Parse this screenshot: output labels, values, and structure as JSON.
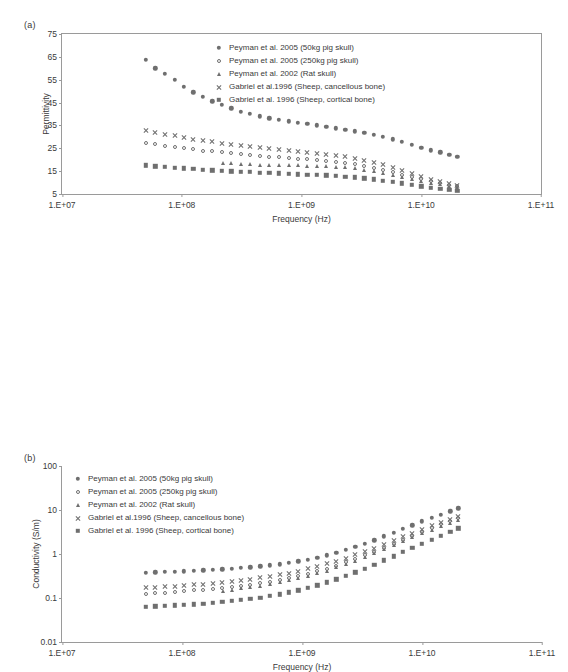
{
  "figure": {
    "panels": [
      {
        "id": "a",
        "label": "(a)",
        "axis_title_x": "Frequency (Hz)",
        "axis_title_y": "Permittivity"
      },
      {
        "id": "b",
        "label": "(b)",
        "axis_title_x": "Frequency (Hz)",
        "axis_title_y": "Conductivity (S/m)"
      }
    ]
  },
  "legend_entries": [
    {
      "marker": "circle-filled",
      "label": "Peyman et al. 2005 (50kg pig skull)"
    },
    {
      "marker": "circle-open",
      "label": "Peyman et al. 2005 (250kg pig skull)"
    },
    {
      "marker": "triangle-filled",
      "label": "Peyman et al. 2002 (Rat skull)"
    },
    {
      "marker": "cross",
      "label": "Gabriel et al.1996 (Sheep, cancellous bone)"
    },
    {
      "marker": "square-filled",
      "label": "Gabriel et al. 1996 (Sheep, cortical bone)"
    }
  ],
  "colors": {
    "marker": "#6f6f6f",
    "axis": "#9a9a9a",
    "text": "#3a3a3a",
    "background": "#ffffff"
  },
  "chart_data": [
    {
      "type": "scatter",
      "panel": "a",
      "title": "",
      "xlabel": "Frequency (Hz)",
      "ylabel": "Permittivity",
      "xscale": "log",
      "yscale": "linear",
      "xlim": [
        10000000,
        100000000000
      ],
      "ylim": [
        5,
        75
      ],
      "xticks": [
        10000000,
        100000000,
        1000000000,
        10000000000,
        100000000000
      ],
      "xticklabels": [
        "1.E+07",
        "1.E+08",
        "1.E+09",
        "1.E+10",
        "1.E+11"
      ],
      "yticks": [
        5,
        15,
        25,
        35,
        45,
        55,
        65,
        75
      ],
      "yticklabels": [
        "5",
        "15",
        "25",
        "35",
        "45",
        "55",
        "65",
        "75"
      ],
      "grid": false,
      "legend_position": "upper-right-inside",
      "series": [
        {
          "name": "Peyman et al. 2005 (50kg pig skull)",
          "marker": "circle-filled",
          "x": [
            50000000.0,
            60000000.0,
            72000000.0,
            87000000.0,
            104000000.0,
            125000000.0,
            150000000.0,
            180000000.0,
            216000000.0,
            260000000.0,
            310000000.0,
            370000000.0,
            450000000.0,
            540000000.0,
            650000000.0,
            780000000.0,
            930000000.0,
            1120000000.0,
            1340000000.0,
            1610000000.0,
            1930000000.0,
            2320000000.0,
            2780000000.0,
            3340000000.0,
            4000000000.0,
            4800000000.0,
            5800000000.0,
            6900000000.0,
            8300000000.0,
            10000000000.0,
            12000000000.0,
            14400000000.0,
            17200000000.0,
            20000000000.0
          ],
          "y": [
            63.8,
            60.0,
            57.5,
            55.0,
            52.0,
            49.5,
            47.5,
            45.5,
            44.0,
            42.5,
            41.0,
            40.0,
            39.0,
            38.2,
            37.5,
            36.8,
            36.2,
            35.6,
            35.0,
            34.4,
            33.8,
            33.2,
            32.5,
            31.8,
            31.0,
            30.0,
            29.0,
            27.8,
            26.5,
            25.3,
            24.2,
            23.2,
            22.2,
            21.3
          ]
        },
        {
          "name": "Peyman et al. 2005 (250kg pig skull)",
          "marker": "circle-open",
          "x": [
            50000000.0,
            60000000.0,
            72000000.0,
            87000000.0,
            104000000.0,
            125000000.0,
            150000000.0,
            180000000.0,
            216000000.0,
            260000000.0,
            310000000.0,
            370000000.0,
            450000000.0,
            540000000.0,
            650000000.0,
            780000000.0,
            930000000.0,
            1120000000.0,
            1340000000.0,
            1610000000.0,
            1930000000.0,
            2320000000.0,
            2780000000.0,
            3340000000.0,
            4000000000.0,
            4800000000.0,
            5800000000.0,
            6900000000.0,
            8300000000.0,
            10000000000.0,
            12000000000.0,
            14400000000.0,
            17200000000.0,
            20000000000.0
          ],
          "y": [
            27.5,
            26.8,
            26.2,
            25.6,
            25.0,
            24.5,
            24.0,
            23.6,
            23.2,
            22.8,
            22.4,
            22.0,
            21.7,
            21.4,
            21.1,
            20.8,
            20.5,
            20.2,
            19.9,
            19.5,
            19.1,
            18.6,
            18.0,
            17.3,
            16.5,
            15.6,
            14.6,
            13.5,
            12.4,
            11.4,
            10.5,
            9.7,
            9.0,
            8.4
          ]
        },
        {
          "name": "Peyman et al. 2002 (Rat skull)",
          "marker": "triangle-filled",
          "x": [
            220000000.0,
            260000000.0,
            310000000.0,
            370000000.0,
            450000000.0,
            540000000.0,
            650000000.0,
            780000000.0,
            930000000.0,
            1120000000.0,
            1340000000.0,
            1610000000.0,
            1930000000.0,
            2320000000.0,
            2780000000.0,
            3340000000.0,
            4000000000.0,
            4800000000.0,
            5800000000.0,
            6900000000.0,
            8300000000.0,
            10000000000.0,
            12000000000.0,
            14400000000.0,
            17200000000.0,
            20000000000.0
          ],
          "y": [
            18.6,
            18.4,
            18.2,
            18.0,
            17.9,
            17.8,
            17.7,
            17.6,
            17.5,
            17.4,
            17.3,
            17.1,
            16.9,
            16.6,
            16.2,
            15.7,
            15.1,
            14.4,
            13.5,
            12.6,
            11.6,
            10.7,
            9.9,
            9.2,
            8.5,
            8.0
          ]
        },
        {
          "name": "Gabriel et al.1996 (Sheep, cancellous bone)",
          "marker": "cross",
          "x": [
            50000000.0,
            60000000.0,
            72000000.0,
            87000000.0,
            104000000.0,
            125000000.0,
            150000000.0,
            180000000.0,
            216000000.0,
            260000000.0,
            310000000.0,
            370000000.0,
            450000000.0,
            540000000.0,
            650000000.0,
            780000000.0,
            930000000.0,
            1120000000.0,
            1340000000.0,
            1610000000.0,
            1930000000.0,
            2320000000.0,
            2780000000.0,
            3340000000.0,
            4000000000.0,
            4800000000.0,
            5800000000.0,
            6900000000.0,
            8300000000.0,
            10000000000.0,
            12000000000.0,
            14400000000.0,
            17200000000.0,
            20000000000.0
          ],
          "y": [
            33.2,
            32.2,
            31.4,
            30.6,
            29.9,
            29.2,
            28.6,
            28.0,
            27.5,
            27.0,
            26.5,
            26.0,
            25.5,
            25.1,
            24.7,
            24.3,
            23.9,
            23.5,
            23.1,
            22.6,
            22.1,
            21.5,
            20.8,
            20.0,
            19.1,
            18.0,
            16.8,
            15.5,
            14.2,
            12.9,
            11.7,
            10.7,
            9.8,
            9.1
          ]
        },
        {
          "name": "Gabriel et al. 1996 (Sheep, cortical bone)",
          "marker": "square-filled",
          "x": [
            50000000.0,
            60000000.0,
            72000000.0,
            87000000.0,
            104000000.0,
            125000000.0,
            150000000.0,
            180000000.0,
            216000000.0,
            260000000.0,
            310000000.0,
            370000000.0,
            450000000.0,
            540000000.0,
            650000000.0,
            780000000.0,
            930000000.0,
            1120000000.0,
            1340000000.0,
            1610000000.0,
            1930000000.0,
            2320000000.0,
            2780000000.0,
            3340000000.0,
            4000000000.0,
            4800000000.0,
            5800000000.0,
            6900000000.0,
            8300000000.0,
            10000000000.0,
            12000000000.0,
            14400000000.0,
            17200000000.0,
            20000000000.0
          ],
          "y": [
            17.6,
            17.2,
            16.8,
            16.5,
            16.2,
            15.9,
            15.6,
            15.4,
            15.2,
            15.0,
            14.8,
            14.6,
            14.4,
            14.2,
            14.0,
            13.8,
            13.6,
            13.5,
            13.3,
            13.1,
            12.9,
            12.6,
            12.3,
            11.9,
            11.4,
            10.9,
            10.3,
            9.6,
            8.9,
            8.3,
            7.7,
            7.2,
            6.8,
            6.5
          ]
        }
      ]
    },
    {
      "type": "scatter",
      "panel": "b",
      "title": "",
      "xlabel": "Frequency (Hz)",
      "ylabel": "Conductivity (S/m)",
      "xscale": "log",
      "yscale": "log",
      "xlim": [
        10000000,
        100000000000
      ],
      "ylim": [
        0.01,
        100
      ],
      "xticks": [
        10000000,
        100000000,
        1000000000,
        10000000000,
        100000000000
      ],
      "xticklabels": [
        "1.E+07",
        "1.E+08",
        "1.E+09",
        "1.E+10",
        "1.E+11"
      ],
      "yticks": [
        0.01,
        0.1,
        1,
        10,
        100
      ],
      "yticklabels": [
        "0.01",
        "0.1",
        "1",
        "10",
        "100"
      ],
      "grid": false,
      "legend_position": "upper-left-inside",
      "series": [
        {
          "name": "Peyman et al. 2005 (50kg pig skull)",
          "marker": "circle-filled",
          "x": [
            50000000.0,
            60000000.0,
            72000000.0,
            87000000.0,
            104000000.0,
            125000000.0,
            150000000.0,
            180000000.0,
            216000000.0,
            260000000.0,
            310000000.0,
            370000000.0,
            450000000.0,
            540000000.0,
            650000000.0,
            780000000.0,
            930000000.0,
            1120000000.0,
            1340000000.0,
            1610000000.0,
            1930000000.0,
            2320000000.0,
            2780000000.0,
            3340000000.0,
            4000000000.0,
            4800000000.0,
            5800000000.0,
            6900000000.0,
            8300000000.0,
            10000000000.0,
            12000000000.0,
            14400000000.0,
            17200000000.0,
            20000000000.0
          ],
          "y": [
            0.375,
            0.382,
            0.39,
            0.398,
            0.406,
            0.415,
            0.425,
            0.436,
            0.448,
            0.462,
            0.478,
            0.497,
            0.52,
            0.548,
            0.582,
            0.625,
            0.678,
            0.745,
            0.83,
            0.935,
            1.07,
            1.24,
            1.45,
            1.72,
            2.05,
            2.5,
            3.05,
            3.7,
            4.5,
            5.5,
            6.6,
            7.9,
            9.4,
            11.0
          ]
        },
        {
          "name": "Peyman et al. 2005 (250kg pig skull)",
          "marker": "circle-open",
          "x": [
            50000000.0,
            60000000.0,
            72000000.0,
            87000000.0,
            104000000.0,
            125000000.0,
            150000000.0,
            180000000.0,
            216000000.0,
            260000000.0,
            310000000.0,
            370000000.0,
            450000000.0,
            540000000.0,
            650000000.0,
            780000000.0,
            930000000.0,
            1120000000.0,
            1340000000.0,
            1610000000.0,
            1930000000.0,
            2320000000.0,
            2780000000.0,
            3340000000.0,
            4000000000.0,
            4800000000.0,
            5800000000.0,
            6900000000.0,
            8300000000.0,
            10000000000.0,
            12000000000.0,
            14400000000.0,
            17200000000.0,
            20000000000.0
          ],
          "y": [
            0.125,
            0.129,
            0.133,
            0.138,
            0.143,
            0.149,
            0.155,
            0.162,
            0.17,
            0.179,
            0.19,
            0.202,
            0.217,
            0.234,
            0.255,
            0.281,
            0.313,
            0.353,
            0.403,
            0.465,
            0.545,
            0.645,
            0.77,
            0.93,
            1.13,
            1.4,
            1.72,
            2.12,
            2.62,
            3.2,
            3.9,
            4.7,
            5.6,
            6.6
          ]
        },
        {
          "name": "Peyman et al. 2002 (Rat skull)",
          "marker": "triangle-filled",
          "x": [
            220000000.0,
            260000000.0,
            310000000.0,
            370000000.0,
            450000000.0,
            540000000.0,
            650000000.0,
            780000000.0,
            930000000.0,
            1120000000.0,
            1340000000.0,
            1610000000.0,
            1930000000.0,
            2320000000.0,
            2780000000.0,
            3340000000.0,
            4000000000.0,
            4800000000.0,
            5800000000.0,
            6900000000.0,
            8300000000.0,
            10000000000.0,
            12000000000.0,
            14400000000.0,
            17200000000.0,
            20000000000.0
          ],
          "y": [
            0.148,
            0.156,
            0.165,
            0.176,
            0.19,
            0.206,
            0.226,
            0.25,
            0.28,
            0.317,
            0.363,
            0.42,
            0.495,
            0.59,
            0.705,
            0.855,
            1.04,
            1.28,
            1.58,
            1.95,
            2.4,
            2.95,
            3.55,
            4.3,
            5.1,
            6.0
          ]
        },
        {
          "name": "Gabriel et al.1996 (Sheep, cancellous bone)",
          "marker": "cross",
          "x": [
            50000000.0,
            60000000.0,
            72000000.0,
            87000000.0,
            104000000.0,
            125000000.0,
            150000000.0,
            180000000.0,
            216000000.0,
            260000000.0,
            310000000.0,
            370000000.0,
            450000000.0,
            540000000.0,
            650000000.0,
            780000000.0,
            930000000.0,
            1120000000.0,
            1340000000.0,
            1610000000.0,
            1930000000.0,
            2320000000.0,
            2780000000.0,
            3340000000.0,
            4000000000.0,
            4800000000.0,
            5800000000.0,
            6900000000.0,
            8300000000.0,
            10000000000.0,
            12000000000.0,
            14400000000.0,
            17200000000.0,
            20000000000.0
          ],
          "y": [
            0.175,
            0.18,
            0.186,
            0.192,
            0.198,
            0.205,
            0.213,
            0.222,
            0.232,
            0.244,
            0.258,
            0.274,
            0.294,
            0.317,
            0.345,
            0.379,
            0.42,
            0.47,
            0.533,
            0.61,
            0.705,
            0.825,
            0.975,
            1.16,
            1.39,
            1.7,
            2.07,
            2.52,
            3.07,
            3.75,
            4.55,
            5.45,
            6.4,
            7.4
          ]
        },
        {
          "name": "Gabriel et al. 1996 (Sheep, cortical bone)",
          "marker": "square-filled",
          "x": [
            50000000.0,
            60000000.0,
            72000000.0,
            87000000.0,
            104000000.0,
            125000000.0,
            150000000.0,
            180000000.0,
            216000000.0,
            260000000.0,
            310000000.0,
            370000000.0,
            450000000.0,
            540000000.0,
            650000000.0,
            780000000.0,
            930000000.0,
            1120000000.0,
            1340000000.0,
            1610000000.0,
            1930000000.0,
            2320000000.0,
            2780000000.0,
            3340000000.0,
            4000000000.0,
            4800000000.0,
            5800000000.0,
            6900000000.0,
            8300000000.0,
            10000000000.0,
            12000000000.0,
            14400000000.0,
            17200000000.0,
            20000000000.0
          ],
          "y": [
            0.063,
            0.0645,
            0.066,
            0.0678,
            0.0698,
            0.072,
            0.0745,
            0.0775,
            0.081,
            0.085,
            0.09,
            0.0955,
            0.102,
            0.111,
            0.121,
            0.134,
            0.15,
            0.17,
            0.196,
            0.228,
            0.268,
            0.32,
            0.385,
            0.468,
            0.575,
            0.715,
            0.89,
            1.11,
            1.38,
            1.72,
            2.13,
            2.6,
            3.15,
            3.8
          ]
        }
      ]
    }
  ]
}
